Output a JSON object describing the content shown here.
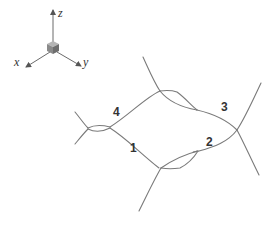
{
  "axes": {
    "z_label": "z",
    "x_label": "x",
    "y_label": "y"
  },
  "edge_labels": {
    "one": "1",
    "two": "2",
    "three": "3",
    "four": "4"
  },
  "colors": {
    "curve": "#7a7a7a",
    "cube_front": "#8a8a8a",
    "cube_top": "#b5b5b5",
    "cube_side": "#6e6e6e",
    "label": "#333333"
  }
}
